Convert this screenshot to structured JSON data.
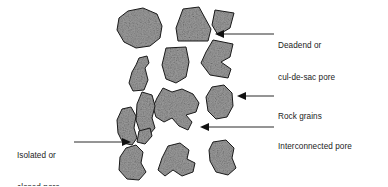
{
  "figure": {
    "background_color": "#ffffff",
    "grain_fill_color": "#909090",
    "grain_outline_color": "#1a1a1a",
    "leader_color": "#2b2b2b",
    "text_color": "#1b1b1b"
  },
  "labels": {
    "deadend": {
      "line1": "Deadend or",
      "line2": "cul-de-sac pore"
    },
    "rock_grains": {
      "line1": "Rock grains"
    },
    "interconnected": {
      "line1": "Interconnected pore"
    },
    "isolated": {
      "line1": "Isolated or",
      "line2": "closed pore"
    }
  },
  "annotations": [
    {
      "name": "deadend-pore",
      "text": "Deadend or cul-de-sac pore",
      "arrow_direction": "left",
      "arrow_tip": [
        215,
        34
      ]
    },
    {
      "name": "rock-grains",
      "text": "Rock grains",
      "arrow_direction": "left",
      "arrow_tip": [
        237,
        96
      ]
    },
    {
      "name": "interconnected-pore",
      "text": "Interconnected pore",
      "arrow_direction": "left",
      "arrow_tip": [
        200,
        127
      ]
    },
    {
      "name": "isolated-closed-pore",
      "text": "Isolated or closed pore",
      "arrow_direction": "right",
      "arrow_tip": [
        131,
        142
      ]
    }
  ],
  "grains": [
    {
      "name": "grain-top-left-rounded"
    },
    {
      "name": "grain-top-wedge"
    },
    {
      "name": "grain-top-right-small-wedge"
    },
    {
      "name": "grain-top-right-zigzag"
    },
    {
      "name": "grain-mid-left-small"
    },
    {
      "name": "grain-mid-center-oval"
    },
    {
      "name": "grain-right-oval"
    },
    {
      "name": "grain-center-lobed"
    },
    {
      "name": "grain-left-tall"
    },
    {
      "name": "grain-left-blob"
    },
    {
      "name": "grain-small-sliver"
    },
    {
      "name": "grain-bottom-left"
    },
    {
      "name": "grain-bottom-center"
    },
    {
      "name": "grain-bottom-right"
    }
  ]
}
